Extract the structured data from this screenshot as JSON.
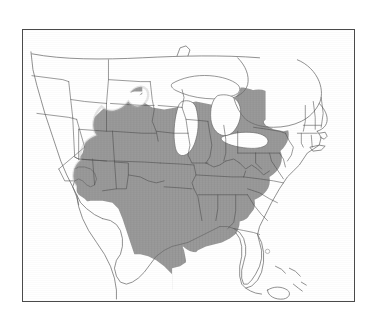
{
  "figure": {
    "type": "map",
    "description": "Outline map of the continental United States with state boundaries; the eastern two-thirds of the country is filled with a uniform medium-gray shading indicating the distribution range.",
    "clipped_text_above": "",
    "frame": {
      "border_color": "#6d6d6d",
      "background_color": "#ffffff",
      "x": 22,
      "y": 29,
      "width": 333,
      "height": 273
    },
    "colors": {
      "range_fill": "#9a9a9a",
      "range_fill_edge": "#b5b5b5",
      "state_boundary": "#4a4a4a",
      "coastline": "#6b6b6b",
      "international_boundary": "#7a7a7a",
      "water": "#ffffff",
      "land_unshaded": "#ffffff"
    },
    "legend_present": false,
    "axis_present": false,
    "labels_present": false
  },
  "map_content": {
    "shaded_label": "Range (shaded)",
    "unshaded_label": "Outside range",
    "shaded_regions": [
      "North Dakota (eastern)",
      "South Dakota (eastern)",
      "Nebraska (eastern)",
      "Kansas (eastern)",
      "Oklahoma (eastern)",
      "Texas (eastern)",
      "Minnesota (southern)",
      "Iowa",
      "Missouri",
      "Arkansas",
      "Louisiana",
      "Wisconsin (southern)",
      "Illinois",
      "Michigan (lower peninsula)",
      "Indiana",
      "Ohio",
      "Kentucky",
      "Tennessee",
      "Mississippi",
      "Alabama",
      "Georgia",
      "Florida",
      "South Carolina",
      "North Carolina",
      "Virginia",
      "West Virginia",
      "Maryland",
      "Delaware",
      "Pennsylvania",
      "New Jersey",
      "New York (southern)",
      "Connecticut",
      "Rhode Island",
      "Massachusetts (southern)"
    ],
    "unshaded_regions": [
      "Washington",
      "Oregon",
      "California",
      "Idaho",
      "Nevada",
      "Utah",
      "Arizona",
      "Montana",
      "Wyoming",
      "Colorado",
      "New Mexico",
      "Texas (western)",
      "North Dakota (western)",
      "South Dakota (western)",
      "Nebraska (western)",
      "Kansas (western)",
      "Minnesota (northern)",
      "Wisconsin (northern)",
      "Michigan (upper peninsula)",
      "New York (northern)",
      "Vermont",
      "New Hampshire",
      "Maine",
      "Canada"
    ],
    "water_features": [
      "Lake Superior",
      "Lake Michigan",
      "Lake Huron",
      "Lake Erie",
      "Lake Ontario",
      "Lake Okeechobee",
      "Gulf of Mexico",
      "Atlantic Ocean"
    ],
    "islands": [
      "Long Island",
      "Florida Keys",
      "Bahamas",
      "Cuba"
    ]
  }
}
